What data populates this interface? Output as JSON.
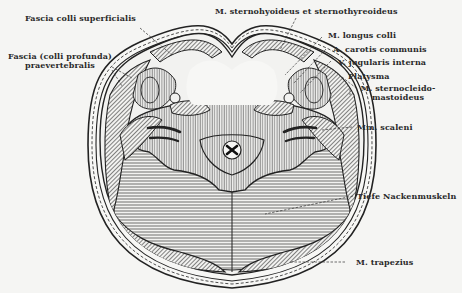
{
  "figure": {
    "labels": {
      "fascia_superficialis": "Fascia colli superficialis",
      "fascia_praevertebralis_1": "Fascia (colli profunda)",
      "fascia_praevertebralis_2": "praevertebralis",
      "sternohyoideus": "M. sternohyoideus et sternothyreoideus",
      "longus_colli": "M. longus colli",
      "carotis": "A. carotis communis",
      "jugularis": "V. jugularis interna",
      "platysma": "Platysma",
      "scm_1": "M. sternocleido-",
      "scm_2": "mastoideus",
      "scaleni": "Mm. scaleni",
      "nackenmuskeln": "Tiefe Nackenmuskeln",
      "trapezius": "M. trapezius"
    }
  },
  "colors": {
    "ink": "#2a2a2a",
    "background": "#f5f5f3"
  }
}
